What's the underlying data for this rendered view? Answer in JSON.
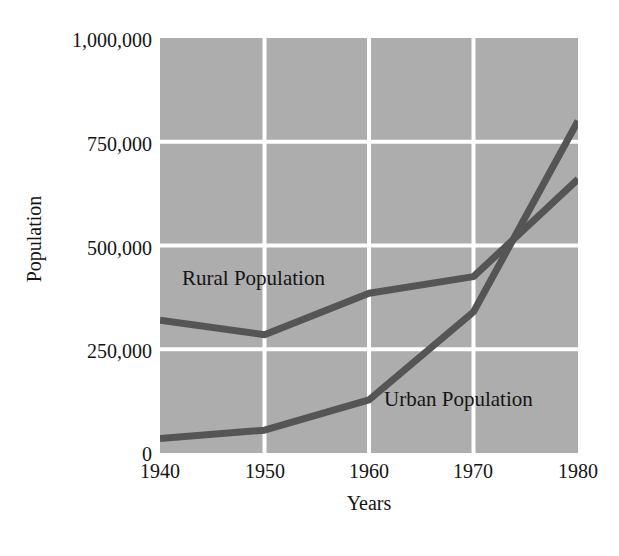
{
  "chart_data": {
    "type": "line",
    "title": "",
    "subtitle": "",
    "xlabel": "Years",
    "ylabel": "Population",
    "x": [
      1940,
      1950,
      1960,
      1970,
      1980
    ],
    "xticklabels": [
      "1940",
      "1950",
      "1960",
      "1970",
      "1980"
    ],
    "yticks": [
      0,
      250000,
      500000,
      750000,
      1000000
    ],
    "yticklabels": [
      "0",
      "250,000",
      "500,000",
      "750,000",
      "1,000,000"
    ],
    "xlim": [
      1940,
      1980
    ],
    "ylim": [
      0,
      1000000
    ],
    "grid": true,
    "grid_color": "#ffffff",
    "plot_background": "#adadad",
    "line_color": "#555555",
    "legend_position": "inline-annotations",
    "series": [
      {
        "name": "Rural Population",
        "label": "Rural Population",
        "values": [
          320000,
          285000,
          385000,
          425000,
          660000
        ],
        "color": "#555555"
      },
      {
        "name": "Urban Population",
        "label": "Urban Population",
        "values": [
          35000,
          55000,
          128000,
          340000,
          800000
        ],
        "color": "#555555"
      }
    ],
    "annotations": [
      {
        "text": "Rural Population",
        "x": 1942,
        "y": 455000
      },
      {
        "text": "Urban Population",
        "x": 1961,
        "y": 160000
      }
    ]
  }
}
